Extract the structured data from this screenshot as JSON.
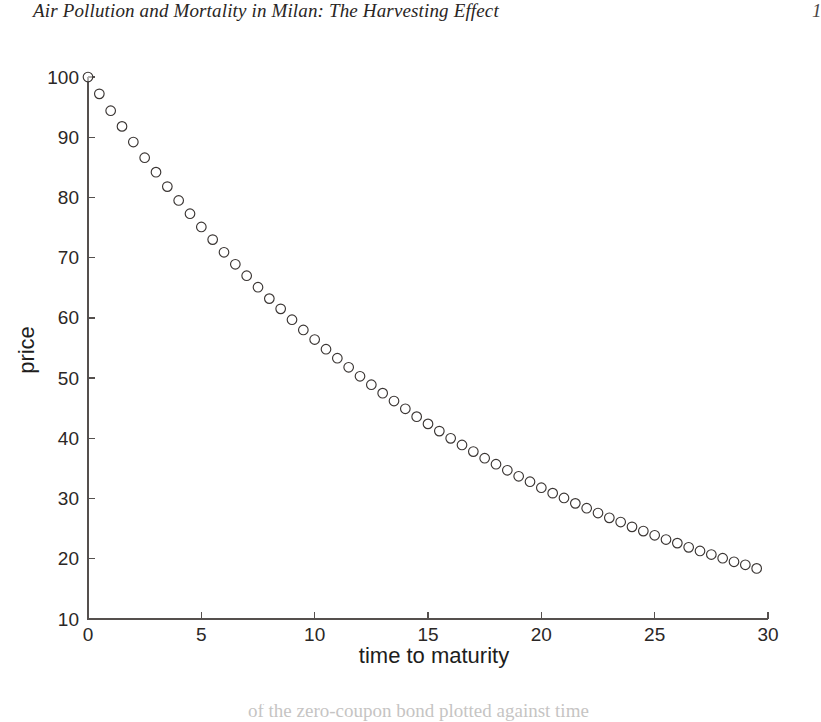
{
  "running_head": {
    "title": "Air Pollution and Mortality in Milan: The Harvesting Effect",
    "page_number": "1"
  },
  "caption": {
    "cutoff_line": "of the zero-coupon bond plotted against time"
  },
  "chart_data": {
    "type": "scatter",
    "title": "",
    "xlabel": "time to maturity",
    "ylabel": "price",
    "xlim": [
      0,
      30
    ],
    "ylim": [
      10,
      100
    ],
    "xticks": [
      0,
      5,
      10,
      15,
      20,
      25,
      30
    ],
    "yticks": [
      10,
      20,
      30,
      40,
      50,
      60,
      70,
      80,
      90,
      100
    ],
    "xtick_labels": [
      "0",
      "5",
      "10",
      "15",
      "20",
      "25",
      "30"
    ],
    "ytick_labels": [
      "10",
      "20",
      "30",
      "40",
      "50",
      "60",
      "70",
      "80",
      "90",
      "100"
    ],
    "grid": false,
    "legend": null,
    "marker": "open-circle",
    "marker_color": "#3b3634",
    "marker_fill": "none",
    "n_points": 60,
    "model": "price = 100 * exp(-0.0575 * t)",
    "x": [
      0.0,
      0.5,
      1.0,
      1.5,
      2.0,
      2.5,
      3.0,
      3.5,
      4.0,
      4.5,
      5.0,
      5.5,
      6.0,
      6.5,
      7.0,
      7.5,
      8.0,
      8.5,
      9.0,
      9.5,
      10.0,
      10.5,
      11.0,
      11.5,
      12.0,
      12.5,
      13.0,
      13.5,
      14.0,
      14.5,
      15.0,
      15.5,
      16.0,
      16.5,
      17.0,
      17.5,
      18.0,
      18.5,
      19.0,
      19.5,
      20.0,
      20.5,
      21.0,
      21.5,
      22.0,
      22.5,
      23.0,
      23.5,
      24.0,
      24.5,
      25.0,
      25.5,
      26.0,
      26.5,
      27.0,
      27.5,
      28.0,
      28.5,
      29.0,
      29.5
    ],
    "y": [
      100.0,
      97.2,
      94.4,
      91.8,
      89.2,
      86.6,
      84.2,
      81.8,
      79.5,
      77.3,
      75.1,
      73.0,
      70.9,
      68.9,
      67.0,
      65.1,
      63.2,
      61.5,
      59.7,
      58.0,
      56.4,
      54.8,
      53.3,
      51.8,
      50.3,
      48.9,
      47.5,
      46.2,
      44.9,
      43.6,
      42.4,
      41.2,
      40.0,
      38.9,
      37.8,
      36.7,
      35.7,
      34.7,
      33.7,
      32.8,
      31.8,
      30.9,
      30.1,
      29.2,
      28.4,
      27.6,
      26.8,
      26.1,
      25.3,
      24.6,
      23.9,
      23.2,
      22.6,
      21.9,
      21.3,
      20.7,
      20.1,
      19.5,
      19.0,
      18.4
    ]
  }
}
